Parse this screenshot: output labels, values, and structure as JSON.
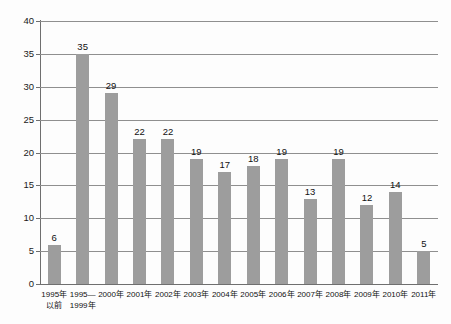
{
  "chart_data": {
    "type": "bar",
    "title": "",
    "subtitle": "",
    "xlabel": "",
    "ylabel": "",
    "ylim": [
      0,
      40
    ],
    "ytick_step": 5,
    "yticks": [
      40,
      35,
      30,
      25,
      20,
      15,
      10,
      5,
      0
    ],
    "grid": true,
    "legend": false,
    "legend_position": "none",
    "bar_color": "#9d9d9d",
    "gridline_color": "#8f8f8f",
    "axis_color": "#6f6f6f",
    "background_color": "#fdfdfd",
    "text_color": "#111111",
    "categories": [
      "1995年\n以前",
      "1995—\n1999年",
      "2000年",
      "2001年",
      "2002年",
      "2003年",
      "2004年",
      "2005年",
      "2006年",
      "2007年",
      "2008年",
      "2009年",
      "2010年",
      "2011年"
    ],
    "values": [
      6,
      35,
      29,
      22,
      22,
      19,
      17,
      18,
      19,
      13,
      19,
      12,
      14,
      5
    ],
    "value_labels": [
      "6",
      "35",
      "29",
      "22",
      "22",
      "19",
      "17",
      "18",
      "19",
      "13",
      "19",
      "12",
      "14",
      "5"
    ]
  }
}
